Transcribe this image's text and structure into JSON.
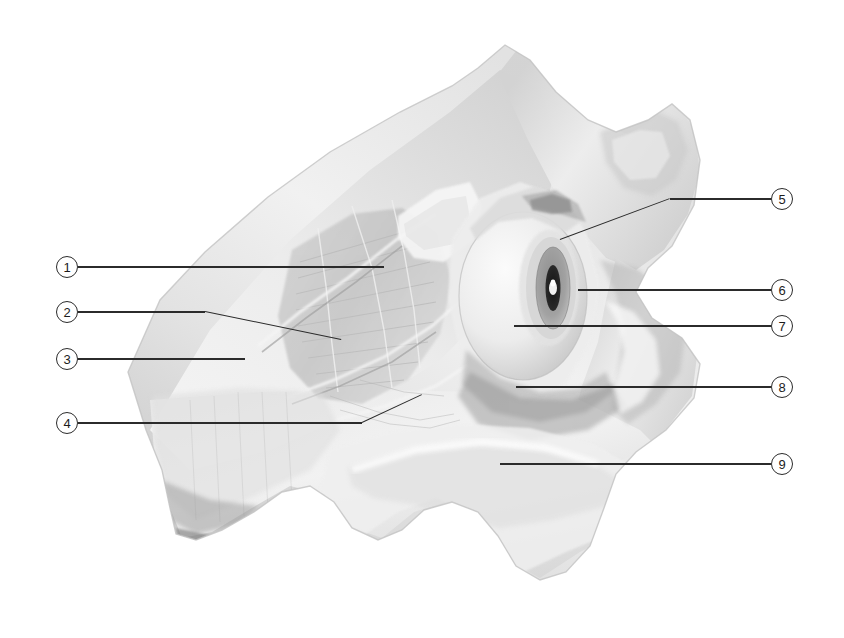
{
  "figure": {
    "type": "anatomical-illustration",
    "background_color": "#ffffff",
    "width": 844,
    "height": 638,
    "line_color": "#2b2b2b",
    "callout_text_color": "#1c1c1c",
    "callout_diameter": 22
  },
  "callouts": [
    {
      "id": "callout-1",
      "number": "1",
      "side": "left",
      "circle": {
        "cx": 67,
        "cy": 267
      },
      "leader": [
        {
          "x": 78,
          "y": 267
        },
        {
          "x": 384,
          "y": 267
        }
      ]
    },
    {
      "id": "callout-2",
      "number": "2",
      "side": "left",
      "circle": {
        "cx": 67,
        "cy": 312
      },
      "leader": [
        {
          "x": 78,
          "y": 312
        },
        {
          "x": 205,
          "y": 312
        },
        {
          "x": 341,
          "y": 340
        }
      ]
    },
    {
      "id": "callout-3",
      "number": "3",
      "side": "left",
      "circle": {
        "cx": 67,
        "cy": 359
      },
      "leader": [
        {
          "x": 78,
          "y": 359
        },
        {
          "x": 245,
          "y": 359
        }
      ]
    },
    {
      "id": "callout-4",
      "number": "4",
      "side": "left",
      "circle": {
        "cx": 67,
        "cy": 423
      },
      "leader": [
        {
          "x": 78,
          "y": 423
        },
        {
          "x": 362,
          "y": 423
        },
        {
          "x": 422,
          "y": 395
        }
      ]
    },
    {
      "id": "callout-5",
      "number": "5",
      "side": "right",
      "circle": {
        "cx": 782,
        "cy": 199
      },
      "leader": [
        {
          "x": 771,
          "y": 199
        },
        {
          "x": 670,
          "y": 199
        },
        {
          "x": 560,
          "y": 240
        }
      ]
    },
    {
      "id": "callout-6",
      "number": "6",
      "side": "right",
      "circle": {
        "cx": 782,
        "cy": 290
      },
      "leader": [
        {
          "x": 771,
          "y": 290
        },
        {
          "x": 578,
          "y": 290
        }
      ]
    },
    {
      "id": "callout-7",
      "number": "7",
      "side": "right",
      "circle": {
        "cx": 782,
        "cy": 326
      },
      "leader": [
        {
          "x": 771,
          "y": 326
        },
        {
          "x": 514,
          "y": 326
        }
      ]
    },
    {
      "id": "callout-8",
      "number": "8",
      "side": "right",
      "circle": {
        "cx": 782,
        "cy": 387
      },
      "leader": [
        {
          "x": 771,
          "y": 387
        },
        {
          "x": 516,
          "y": 387
        }
      ]
    },
    {
      "id": "callout-9",
      "number": "9",
      "side": "right",
      "circle": {
        "cx": 782,
        "cy": 464
      },
      "leader": [
        {
          "x": 771,
          "y": 464
        },
        {
          "x": 500,
          "y": 464
        }
      ]
    }
  ],
  "palette": {
    "bone_light": "#f3f3f3",
    "bone_mid": "#dcdcdc",
    "bone_shadow": "#b9b9b9",
    "bone_deep_shadow": "#9b9b9b",
    "fibrous_grey": "#c7c7c7",
    "eye_sclera": "#e8e8e8",
    "iris_ring": "#8e8e8e",
    "pupil_dark": "#1f1f1f",
    "pupil_highlight": "#fdfdfd",
    "outline_grey": "#a8a8a8"
  }
}
